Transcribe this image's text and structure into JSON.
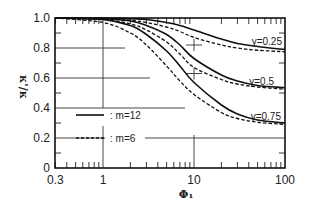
{
  "chart_data": {
    "type": "line",
    "title": "",
    "xlabel": "Φ₁",
    "ylabel": "κ'/κ",
    "xscale": "log",
    "xlim": [
      0.3,
      100
    ],
    "ylim": [
      0,
      1.0
    ],
    "x_ticks": [
      "0.3",
      "1",
      "10",
      "100"
    ],
    "y_ticks": [
      "0",
      "0.2",
      "0.4",
      "0.6",
      "0.8",
      "1.0"
    ],
    "grid": "partial",
    "legend": [
      {
        "label": ": m=12",
        "style": "solid"
      },
      {
        "label": ": m=6",
        "style": "dashed"
      }
    ],
    "annotations": [
      "γ=0.25",
      "γ=0.5",
      "γ=0.75"
    ],
    "x": [
      0.3,
      1,
      2,
      3,
      5,
      7,
      10,
      20,
      30,
      50,
      100
    ],
    "series": [
      {
        "name": "γ=0.25, m=12",
        "style": "solid",
        "values": [
          1.0,
          1.0,
          0.995,
          0.99,
          0.97,
          0.95,
          0.92,
          0.86,
          0.83,
          0.81,
          0.79
        ]
      },
      {
        "name": "γ=0.25, m=6",
        "style": "dashed",
        "values": [
          1.0,
          0.995,
          0.985,
          0.97,
          0.94,
          0.91,
          0.87,
          0.82,
          0.8,
          0.785,
          0.775
        ]
      },
      {
        "name": "γ=0.5, m=12",
        "style": "solid",
        "values": [
          1.0,
          0.995,
          0.98,
          0.95,
          0.89,
          0.82,
          0.73,
          0.62,
          0.58,
          0.55,
          0.535
        ]
      },
      {
        "name": "γ=0.5, m=6",
        "style": "dashed",
        "values": [
          1.0,
          0.99,
          0.96,
          0.92,
          0.84,
          0.76,
          0.67,
          0.59,
          0.56,
          0.54,
          0.525
        ]
      },
      {
        "name": "γ=0.75, m=12",
        "style": "solid",
        "values": [
          1.0,
          0.99,
          0.95,
          0.89,
          0.78,
          0.68,
          0.57,
          0.42,
          0.36,
          0.32,
          0.3
        ]
      },
      {
        "name": "γ=0.75, m=6",
        "style": "dashed",
        "values": [
          1.0,
          0.97,
          0.9,
          0.82,
          0.68,
          0.58,
          0.49,
          0.37,
          0.33,
          0.305,
          0.29
        ]
      }
    ]
  }
}
